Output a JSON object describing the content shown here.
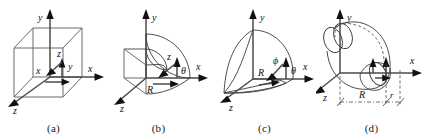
{
  "figure": {
    "background_color": "#ffffff",
    "line_color": "#3a3a3a",
    "axis_color": "#4a4a4a",
    "arrow_color": "#111111",
    "panel_count": 4
  },
  "panels": [
    {
      "id": "a",
      "caption": "(a)",
      "axis_labels": {
        "x": "x",
        "y": "y",
        "z": "z"
      },
      "inner_labels": [
        {
          "text": "x",
          "role": "inner-x"
        },
        {
          "text": "y",
          "role": "inner-y"
        },
        {
          "text": "z",
          "role": "inner-z"
        }
      ],
      "shape": "cube"
    },
    {
      "id": "b",
      "caption": "(b)",
      "axis_labels": {
        "x": "x",
        "y": "y",
        "z": "z"
      },
      "inner_labels": [
        {
          "text": "z",
          "role": "inner-z"
        },
        {
          "text": "R",
          "role": "radius"
        },
        {
          "text": "θ",
          "role": "angle-theta"
        }
      ],
      "shape": "quarter-sphere-wedge"
    },
    {
      "id": "c",
      "caption": "(c)",
      "axis_labels": {
        "x": "x",
        "y": "y",
        "z": "z"
      },
      "inner_labels": [
        {
          "text": "R",
          "role": "radius"
        },
        {
          "text": "ϕ",
          "role": "angle-phi"
        },
        {
          "text": "θ",
          "role": "angle-theta"
        }
      ],
      "shape": "sphere-sector"
    },
    {
      "id": "d",
      "caption": "(d)",
      "axis_labels": {
        "x": "x",
        "y": "y",
        "z": "z"
      },
      "inner_labels": [
        {
          "text": "R",
          "role": "major-radius"
        },
        {
          "text": "r",
          "role": "minor-radius"
        }
      ],
      "shape": "torus"
    }
  ]
}
